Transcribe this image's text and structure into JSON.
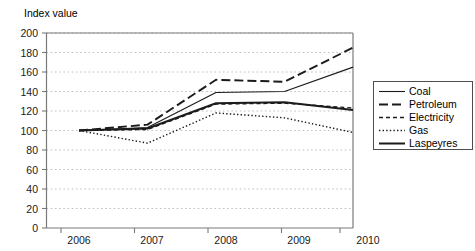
{
  "chart_data": {
    "type": "line",
    "title": "",
    "ylabel": "Index value",
    "xlabel": "",
    "x": [
      2006,
      2007,
      2008,
      2009,
      2010
    ],
    "categories": [
      "2006",
      "2007",
      "2008",
      "2009",
      "2010"
    ],
    "ylim": [
      0,
      200
    ],
    "yticks": [
      0,
      20,
      40,
      60,
      80,
      100,
      120,
      140,
      160,
      180,
      200
    ],
    "ytick_labels": [
      "0",
      "20",
      "40",
      "60",
      "80",
      "100",
      "120",
      "140",
      "160",
      "180",
      "200"
    ],
    "xtick_labels": [
      "2006",
      "2007",
      "2008",
      "2009",
      "2010"
    ],
    "grid": "horizontal-dotted",
    "legend_position": "right",
    "series": [
      {
        "name": "Coal",
        "values": [
          100,
          103,
          139,
          140,
          165
        ],
        "style": "solid-thin"
      },
      {
        "name": "Petroleum",
        "values": [
          100,
          106,
          152,
          150,
          185
        ],
        "style": "dashed-long"
      },
      {
        "name": "Electricity",
        "values": [
          100,
          101,
          127,
          128,
          123
        ],
        "style": "dashed-short"
      },
      {
        "name": "Gas",
        "values": [
          100,
          87,
          118,
          113,
          98
        ],
        "style": "dotted"
      },
      {
        "name": "Laspeyres",
        "values": [
          100,
          102,
          128,
          129,
          121
        ],
        "style": "solid-thick"
      }
    ]
  },
  "legend": {
    "items": [
      {
        "label": "Coal"
      },
      {
        "label": "Petroleum"
      },
      {
        "label": "Electricity"
      },
      {
        "label": "Gas"
      },
      {
        "label": "Laspeyres"
      }
    ]
  },
  "colors": {
    "ink": "#1b1b1b",
    "grid": "#b9b9b9",
    "axis": "#7a7a7a",
    "background": "#ffffff"
  }
}
